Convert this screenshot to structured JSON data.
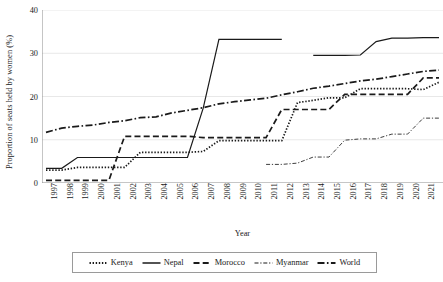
{
  "chart_data": {
    "type": "line",
    "title": "",
    "xlabel": "Year",
    "ylabel": "Proportion of seats held by women (%)",
    "xlim": [
      1997,
      2022
    ],
    "ylim": [
      0,
      40
    ],
    "yticks": [
      0,
      10,
      20,
      30,
      40
    ],
    "grid": "horizontal",
    "legend_position": "bottom",
    "x": [
      1997,
      1998,
      1999,
      2000,
      2001,
      2002,
      2003,
      2004,
      2005,
      2006,
      2007,
      2008,
      2009,
      2010,
      2011,
      2012,
      2013,
      2014,
      2015,
      2016,
      2017,
      2018,
      2019,
      2020,
      2021,
      2022
    ],
    "categories": [
      "1997",
      "1998",
      "1999",
      "2000",
      "2001",
      "2002",
      "2003",
      "2004",
      "2005",
      "2006",
      "2007",
      "2008",
      "2009",
      "2010",
      "2011",
      "2012",
      "2013",
      "2014",
      "2015",
      "2016",
      "2017",
      "2018",
      "2019",
      "2020",
      "2021",
      "2022"
    ],
    "series": [
      {
        "name": "Kenya",
        "dash": "dotted",
        "values": [
          3.0,
          3.0,
          3.6,
          3.6,
          3.6,
          3.6,
          7.1,
          7.1,
          7.1,
          7.1,
          7.3,
          9.8,
          9.8,
          9.8,
          9.8,
          9.8,
          18.6,
          19.1,
          19.7,
          19.7,
          21.8,
          21.8,
          21.8,
          21.8,
          21.6,
          23.3
        ]
      },
      {
        "name": "Nepal",
        "dash": "solid",
        "values": [
          3.4,
          3.4,
          5.9,
          5.9,
          5.9,
          5.9,
          5.9,
          5.9,
          5.9,
          5.9,
          17.3,
          33.2,
          33.2,
          33.2,
          33.2,
          33.2,
          null,
          29.5,
          29.5,
          29.5,
          29.6,
          32.7,
          33.5,
          33.5,
          33.6,
          33.6
        ]
      },
      {
        "name": "Morocco",
        "dash": "dashed",
        "values": [
          0.6,
          0.6,
          0.6,
          0.6,
          0.6,
          10.8,
          10.8,
          10.8,
          10.8,
          10.8,
          10.5,
          10.5,
          10.5,
          10.5,
          10.5,
          17.0,
          17.0,
          17.0,
          17.0,
          20.5,
          20.5,
          20.5,
          20.5,
          20.5,
          24.3,
          24.3
        ]
      },
      {
        "name": "Myanmar",
        "dash": "fine-dash-dot",
        "values": [
          null,
          null,
          null,
          null,
          null,
          null,
          null,
          null,
          null,
          null,
          null,
          null,
          null,
          null,
          4.3,
          4.3,
          4.6,
          6.0,
          6.0,
          9.9,
          10.2,
          10.2,
          11.3,
          11.3,
          15.0,
          15.0
        ]
      },
      {
        "name": "World",
        "dash": "dash-dot",
        "values": [
          11.7,
          12.7,
          13.1,
          13.4,
          14.0,
          14.4,
          15.1,
          15.3,
          16.2,
          16.8,
          17.4,
          18.3,
          18.8,
          19.2,
          19.6,
          20.4,
          21.1,
          21.9,
          22.4,
          23.0,
          23.6,
          24.0,
          24.6,
          25.2,
          25.8,
          26.1
        ]
      }
    ]
  },
  "legend": {
    "items": [
      {
        "label": "Kenya",
        "style": "dotted"
      },
      {
        "label": "Nepal",
        "style": "solid"
      },
      {
        "label": "Morocco",
        "style": "dashed"
      },
      {
        "label": "Myanmar",
        "style": "fine-dash-dot"
      },
      {
        "label": "World",
        "style": "dash-dot"
      }
    ]
  },
  "colors": {
    "line": "#1a1a1a",
    "grid": "#e8e8e8",
    "axis": "#8c8c8c",
    "background": "#ffffff"
  }
}
